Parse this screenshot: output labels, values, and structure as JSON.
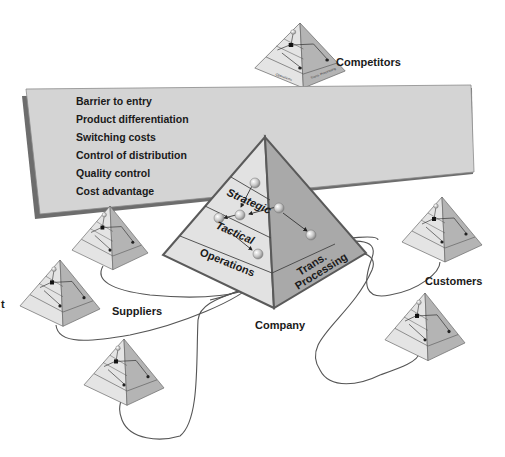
{
  "diagram": {
    "background": "#ffffff",
    "banner": {
      "fill": "#d4d4d4",
      "shadow": "#6d6d6d",
      "items": [
        "Barrier to entry",
        "Product differentiation",
        "Switching costs",
        "Control of distribution",
        "Quality control",
        "Cost advantage"
      ]
    },
    "company": {
      "label": "Company",
      "levels": {
        "strategic": "Strategic",
        "tactical": "Tactical",
        "operations": "Operations",
        "trans_line1": "Trans.",
        "trans_line2": "Processing"
      },
      "colors": {
        "left_face": "#e2e2e2",
        "right_face": "#a9a9a9",
        "edge": "#5a5a5a"
      }
    },
    "groups": {
      "competitors": "Competitors",
      "suppliers": "Suppliers",
      "customers": "Customers"
    },
    "mini_pyramid": {
      "operations": "Operations",
      "trans_processing": "Trans. Processing"
    },
    "left_edge_fragment": "t"
  }
}
